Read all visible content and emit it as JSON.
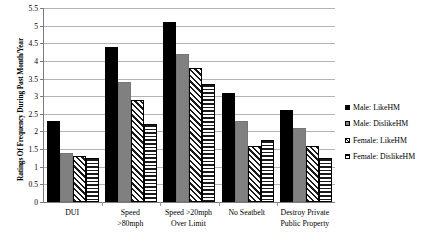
{
  "chart_data": {
    "type": "bar",
    "title": "",
    "xlabel": "",
    "ylabel": "Ratings Of Frequency During Past Month/Year",
    "ylim": [
      0,
      5.5
    ],
    "ytick_step": 0.5,
    "yticks": [
      "0",
      "0.5",
      "1",
      "1.5",
      "2",
      "2.5",
      "3",
      "3.5",
      "4",
      "4.5",
      "5",
      "5.5"
    ],
    "grid": true,
    "legend_position": "right",
    "categories": [
      "DUI",
      "Speed\n>80mph",
      "Speed >20mph\nOver Limit",
      "No Seatbelt",
      "Destroy Private\nPublic Property"
    ],
    "category_lines": [
      [
        "DUI"
      ],
      [
        "Speed",
        ">80mph"
      ],
      [
        "Speed >20mph",
        "Over Limit"
      ],
      [
        "No Seatbelt"
      ],
      [
        "Destroy Private",
        "Public Property"
      ]
    ],
    "series": [
      {
        "name": "Male: LikeHM",
        "pattern": "solid-black",
        "color": "#000000",
        "values": [
          2.3,
          4.4,
          5.1,
          3.1,
          2.6
        ]
      },
      {
        "name": "Male: DislikeHM",
        "pattern": "solid-gray",
        "color": "#808080",
        "values": [
          1.4,
          3.4,
          4.2,
          2.3,
          2.1
        ]
      },
      {
        "name": "Female: LikeHM",
        "pattern": "diagonal-hatch",
        "color": "#ffffff",
        "values": [
          1.3,
          2.9,
          3.8,
          1.6,
          1.6
        ]
      },
      {
        "name": "Female: DislikeHM",
        "pattern": "horizontal-hatch",
        "color": "#ffffff",
        "values": [
          1.25,
          2.2,
          3.35,
          1.75,
          1.25
        ]
      }
    ]
  }
}
